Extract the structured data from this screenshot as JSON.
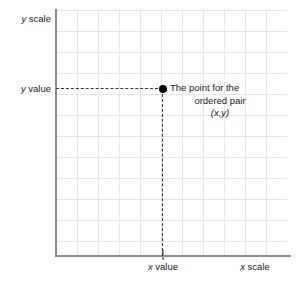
{
  "figure": {
    "background_color": "#ffffff",
    "grid_color": "#e6e6e6",
    "axis_color": "#8c8c8c",
    "guide_color": "#333333",
    "point_color": "#000000",
    "text_color": "#1a1a1a"
  },
  "labels": {
    "y_scale": "y scale",
    "y_scale_italic": "y",
    "y_scale_rest": " scale",
    "y_value_italic": "y",
    "y_value_rest": " value",
    "x_value_italic": "x",
    "x_value_rest": " value",
    "x_scale_italic": "x",
    "x_scale_rest": " scale"
  },
  "annotation": {
    "line1": "The point for the",
    "line2": "ordered pair",
    "line3": "(x,y)"
  },
  "chart_data": {
    "type": "scatter",
    "title": "",
    "xlabel": "x scale",
    "ylabel": "y scale",
    "grid": true,
    "legend": "none",
    "x_axis": {
      "label": "x scale",
      "tick_labels": [
        "x value"
      ],
      "tick_positions": [
        "x"
      ]
    },
    "y_axis": {
      "label": "y scale",
      "tick_labels": [
        "y value"
      ],
      "tick_positions": [
        "y"
      ]
    },
    "points": [
      {
        "x_label": "x value",
        "y_label": "y value",
        "annotation": "The point for the ordered pair (x,y)",
        "marker": "filled-circle",
        "guide_lines": [
          "horizontal-dashed-to-y-axis",
          "vertical-dashed-to-x-axis"
        ]
      }
    ],
    "grid_columns": 11,
    "grid_rows": 12
  }
}
